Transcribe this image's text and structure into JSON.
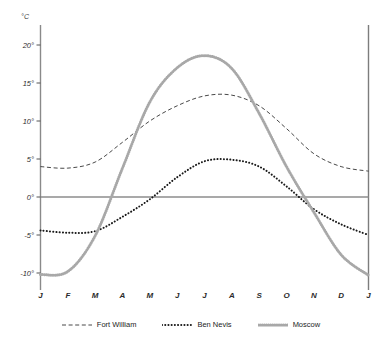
{
  "chart_data": {
    "type": "line",
    "title": "",
    "subtitle": "",
    "xlabel": "",
    "ylabel": "°C",
    "unit_label": "°C",
    "grid": false,
    "legend_position": "bottom",
    "categories": [
      "J",
      "F",
      "M",
      "A",
      "M",
      "J",
      "J",
      "A",
      "S",
      "O",
      "N",
      "D",
      "J"
    ],
    "x_tick_labels": [
      "J",
      "F",
      "M",
      "A",
      "M",
      "J",
      "J",
      "A",
      "S",
      "O",
      "N",
      "D",
      "J"
    ],
    "y_tick_labels": [
      "20°",
      "15°",
      "10°",
      "5°",
      "0°",
      "-5°",
      "-10°"
    ],
    "y_tick_values": [
      20,
      15,
      10,
      5,
      0,
      -5,
      -10
    ],
    "ylim": [
      -11.5,
      22
    ],
    "xlim": [
      0,
      12
    ],
    "zero_line": 0,
    "series": [
      {
        "name": "Fort William",
        "style": "dashed",
        "color": "#333333",
        "values": [
          4.0,
          3.8,
          4.6,
          7.2,
          10.0,
          12.0,
          13.3,
          13.4,
          12.0,
          9.0,
          5.7,
          4.0,
          3.4
        ]
      },
      {
        "name": "Ben Nevis",
        "style": "dotted",
        "color": "#1a1a1a",
        "values": [
          -4.4,
          -4.7,
          -4.5,
          -2.6,
          -0.3,
          2.6,
          4.7,
          4.9,
          4.0,
          1.4,
          -1.6,
          -3.6,
          -5.0
        ]
      },
      {
        "name": "Moscow",
        "style": "thick-dotted",
        "color": "#a8a8a8",
        "values": [
          -10.2,
          -9.8,
          -5.1,
          3.8,
          12.5,
          17.0,
          18.6,
          16.9,
          11.0,
          4.0,
          -2.0,
          -7.6,
          -10.3
        ]
      }
    ]
  },
  "legend": {
    "items": [
      {
        "label": "Fort William",
        "style": "dashed",
        "color": "#333333"
      },
      {
        "label": "Ben Nevis",
        "style": "dotted",
        "color": "#1a1a1a"
      },
      {
        "label": "Moscow",
        "style": "thick-dotted",
        "color": "#a8a8a8"
      }
    ]
  },
  "axes": {
    "unit": "°C",
    "left_axis_color": "#8a8a8a",
    "right_axis_color": "#7d7d7d",
    "zero_line_color": "#8c8c8c"
  }
}
